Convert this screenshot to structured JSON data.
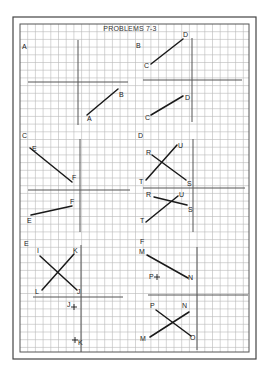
{
  "title": "PROBLEMS 7-3",
  "colors": {
    "paper": "#ffffff",
    "grid": "#b9b9b9",
    "axis": "#555555",
    "frame": "#444444",
    "line": "#1a1a1a"
  },
  "frame": {
    "outer": {
      "x": 13,
      "y": 17,
      "w": 243,
      "h": 342
    },
    "inner": {
      "x": 20,
      "y": 24,
      "w": 229,
      "h": 328
    },
    "grid_step": 7.7
  },
  "panels": [
    {
      "id": "A",
      "label": {
        "text": "A",
        "x": 22,
        "y": 49
      },
      "axes": {
        "v": {
          "x": 78,
          "y1": 40,
          "y2": 125
        },
        "h": {
          "y": 82,
          "x1": 28,
          "x2": 128
        }
      },
      "segments": [
        {
          "x1": 87,
          "y1": 115,
          "x2": 118,
          "y2": 89
        }
      ],
      "points": [
        {
          "text": "A",
          "x": 87,
          "y": 121
        },
        {
          "text": "B",
          "x": 119,
          "y": 97
        }
      ],
      "markers": []
    },
    {
      "id": "B",
      "label": {
        "text": "B",
        "x": 136,
        "y": 48
      },
      "axes": {
        "v": {
          "x": 192,
          "y1": 38,
          "y2": 122
        },
        "h": {
          "y": 80,
          "x1": 143,
          "x2": 242
        }
      },
      "segments": [
        {
          "x1": 151,
          "y1": 64,
          "x2": 183,
          "y2": 39
        },
        {
          "x1": 151,
          "y1": 115,
          "x2": 183,
          "y2": 96
        }
      ],
      "points": [
        {
          "text": "C",
          "x": 144,
          "y": 68
        },
        {
          "text": "D",
          "x": 183,
          "y": 37
        },
        {
          "text": "C",
          "x": 145,
          "y": 120
        },
        {
          "text": "D",
          "x": 185,
          "y": 100
        }
      ],
      "markers": []
    },
    {
      "id": "C",
      "label": {
        "text": "C",
        "x": 22,
        "y": 138
      },
      "axes": {
        "v": {
          "x": 80,
          "y1": 139,
          "y2": 232
        },
        "h": {
          "y": 190,
          "x1": 28,
          "x2": 130
        }
      },
      "segments": [
        {
          "x1": 30,
          "y1": 148,
          "x2": 72,
          "y2": 182
        },
        {
          "x1": 31,
          "y1": 215,
          "x2": 72,
          "y2": 206
        }
      ],
      "points": [
        {
          "text": "E",
          "x": 32,
          "y": 151
        },
        {
          "text": "F",
          "x": 72,
          "y": 180
        },
        {
          "text": "F",
          "x": 70,
          "y": 204
        },
        {
          "text": "E",
          "x": 27,
          "y": 223
        }
      ],
      "markers": []
    },
    {
      "id": "D",
      "label": {
        "text": "D",
        "x": 138,
        "y": 138
      },
      "axes": {
        "v": {
          "x": 193,
          "y1": 139,
          "y2": 232
        },
        "h": {
          "y": 188,
          "x1": 143,
          "x2": 245
        }
      },
      "segments": [
        {
          "x1": 152,
          "y1": 155,
          "x2": 186,
          "y2": 180
        },
        {
          "x1": 146,
          "y1": 180,
          "x2": 177,
          "y2": 145
        },
        {
          "x1": 154,
          "y1": 197,
          "x2": 187,
          "y2": 205
        },
        {
          "x1": 146,
          "y1": 222,
          "x2": 178,
          "y2": 196
        }
      ],
      "points": [
        {
          "text": "R",
          "x": 146,
          "y": 155
        },
        {
          "text": "U",
          "x": 178,
          "y": 148
        },
        {
          "text": "T",
          "x": 139,
          "y": 184
        },
        {
          "text": "S",
          "x": 187,
          "y": 186
        },
        {
          "text": "R",
          "x": 146,
          "y": 197
        },
        {
          "text": "U",
          "x": 179,
          "y": 197
        },
        {
          "text": "S",
          "x": 188,
          "y": 212
        },
        {
          "text": "T",
          "x": 140,
          "y": 223
        }
      ],
      "markers": []
    },
    {
      "id": "E",
      "label": {
        "text": "E",
        "x": 24,
        "y": 246
      },
      "axes": {
        "v": {
          "x": 81,
          "y1": 245,
          "y2": 352
        },
        "h": {
          "y": 297,
          "x1": 33,
          "x2": 123
        }
      },
      "segments": [
        {
          "x1": 40,
          "y1": 256,
          "x2": 77,
          "y2": 290
        },
        {
          "x1": 42,
          "y1": 290,
          "x2": 74,
          "y2": 254
        }
      ],
      "points": [
        {
          "text": "I",
          "x": 37,
          "y": 253
        },
        {
          "text": "K",
          "x": 73,
          "y": 253
        },
        {
          "text": "L",
          "x": 35,
          "y": 294
        },
        {
          "text": "J",
          "x": 77,
          "y": 294
        }
      ],
      "markers": [
        {
          "text": "J",
          "x": 74,
          "y": 307,
          "label_dx": -7,
          "label_dy": 0
        },
        {
          "text": "K",
          "x": 75,
          "y": 340,
          "label_dx": 3,
          "label_dy": 5
        }
      ]
    },
    {
      "id": "F",
      "label": {
        "text": "F",
        "x": 140,
        "y": 244
      },
      "axes": {
        "v": {
          "x": 197,
          "y1": 247,
          "y2": 350
        },
        "h": {
          "y": 295,
          "x1": 148,
          "x2": 248
        }
      },
      "segments": [
        {
          "x1": 147,
          "y1": 255,
          "x2": 188,
          "y2": 278
        },
        {
          "x1": 156,
          "y1": 310,
          "x2": 191,
          "y2": 336
        },
        {
          "x1": 150,
          "y1": 337,
          "x2": 189,
          "y2": 312
        }
      ],
      "points": [
        {
          "text": "M",
          "x": 139,
          "y": 254
        },
        {
          "text": "N",
          "x": 188,
          "y": 280
        },
        {
          "text": "P",
          "x": 150,
          "y": 308
        },
        {
          "text": "N",
          "x": 182,
          "y": 308
        },
        {
          "text": "M",
          "x": 140,
          "y": 341
        },
        {
          "text": "O",
          "x": 190,
          "y": 340
        }
      ],
      "markers": [
        {
          "text": "P",
          "x": 157,
          "y": 277,
          "label_dx": -8,
          "label_dy": 2
        }
      ]
    }
  ]
}
